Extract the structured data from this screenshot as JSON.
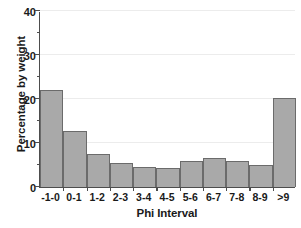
{
  "chart_data": {
    "type": "bar",
    "title": "",
    "xlabel": "Phi Interval",
    "ylabel": "Percentage by weight",
    "categories": [
      "-1-0",
      "0-1",
      "1-2",
      "2-3",
      "3-4",
      "4-5",
      "5-6",
      "6-7",
      "7-8",
      "8-9",
      ">9"
    ],
    "values": [
      22.0,
      12.7,
      7.5,
      5.4,
      4.5,
      4.3,
      6.0,
      6.6,
      6.0,
      4.9,
      20.2
    ],
    "ylim": [
      0,
      40
    ],
    "y_major_ticks": [
      0,
      10,
      20,
      30,
      40
    ],
    "y_minor_ticks": [
      5,
      15,
      25,
      35
    ],
    "y_tick_labels": [
      "0",
      "10",
      "20",
      "30",
      "40"
    ],
    "grid": true,
    "gridlines_at": [
      10,
      20,
      30,
      40
    ],
    "legend": null,
    "legend_position": "none",
    "bar_fill_color": "#a9a9a9",
    "bar_edge_color": "#6b6b6b",
    "axis_color": "#4d4d4d",
    "grid_color": "#ececec",
    "background_color": "#ffffff",
    "text_color": "#1a1a1a"
  }
}
